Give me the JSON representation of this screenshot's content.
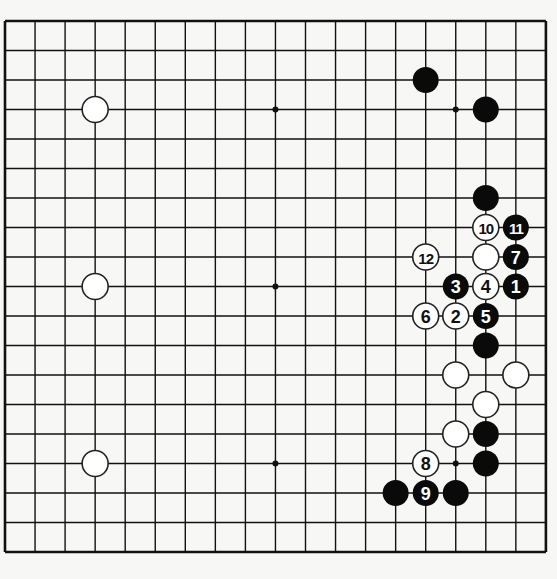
{
  "board": {
    "size": 19,
    "origin": {
      "x": 5,
      "y": 21
    },
    "spacing": {
      "x": 30.05,
      "y": 29.5
    },
    "stone_radius": 13,
    "colors": {
      "background": "#f7f7f5",
      "line": "#111111",
      "black_stone": "#0a0a0a",
      "white_stone": "#ffffff",
      "white_label": "#111111",
      "black_label": "#ffffff"
    },
    "star_points": [
      [
        3,
        3
      ],
      [
        9,
        3
      ],
      [
        15,
        3
      ],
      [
        3,
        9
      ],
      [
        9,
        9
      ],
      [
        15,
        9
      ],
      [
        3,
        15
      ],
      [
        9,
        15
      ],
      [
        15,
        15
      ]
    ]
  },
  "stones": [
    {
      "color": "white",
      "col": 3,
      "row": 3,
      "label": ""
    },
    {
      "color": "white",
      "col": 3,
      "row": 9,
      "label": ""
    },
    {
      "color": "white",
      "col": 3,
      "row": 15,
      "label": ""
    },
    {
      "color": "black",
      "col": 14,
      "row": 2,
      "label": ""
    },
    {
      "color": "black",
      "col": 16,
      "row": 3,
      "label": ""
    },
    {
      "color": "black",
      "col": 16,
      "row": 6,
      "label": ""
    },
    {
      "color": "white",
      "col": 16,
      "row": 7,
      "label": "10"
    },
    {
      "color": "black",
      "col": 17,
      "row": 7,
      "label": "11"
    },
    {
      "color": "white",
      "col": 14,
      "row": 8,
      "label": "12"
    },
    {
      "color": "white",
      "col": 16,
      "row": 8,
      "label": ""
    },
    {
      "color": "black",
      "col": 17,
      "row": 8,
      "label": "7"
    },
    {
      "color": "black",
      "col": 15,
      "row": 9,
      "label": "3"
    },
    {
      "color": "white",
      "col": 16,
      "row": 9,
      "label": "4"
    },
    {
      "color": "black",
      "col": 17,
      "row": 9,
      "label": "1"
    },
    {
      "color": "white",
      "col": 14,
      "row": 10,
      "label": "6"
    },
    {
      "color": "white",
      "col": 15,
      "row": 10,
      "label": "2"
    },
    {
      "color": "black",
      "col": 16,
      "row": 10,
      "label": "5"
    },
    {
      "color": "black",
      "col": 16,
      "row": 11,
      "label": ""
    },
    {
      "color": "white",
      "col": 15,
      "row": 12,
      "label": ""
    },
    {
      "color": "white",
      "col": 17,
      "row": 12,
      "label": ""
    },
    {
      "color": "white",
      "col": 16,
      "row": 13,
      "label": ""
    },
    {
      "color": "white",
      "col": 15,
      "row": 14,
      "label": ""
    },
    {
      "color": "black",
      "col": 16,
      "row": 14,
      "label": ""
    },
    {
      "color": "white",
      "col": 14,
      "row": 15,
      "label": "8"
    },
    {
      "color": "black",
      "col": 16,
      "row": 15,
      "label": ""
    },
    {
      "color": "black",
      "col": 13,
      "row": 16,
      "label": ""
    },
    {
      "color": "black",
      "col": 14,
      "row": 16,
      "label": "9"
    },
    {
      "color": "black",
      "col": 15,
      "row": 16,
      "label": ""
    }
  ]
}
